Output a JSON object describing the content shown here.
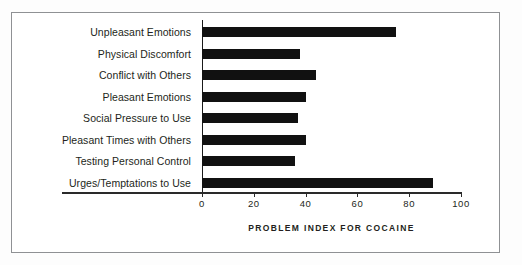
{
  "chart_data": {
    "type": "bar",
    "orientation": "horizontal",
    "title": "",
    "xlabel": "PROBLEM INDEX FOR COCAINE",
    "ylabel": "",
    "xlim": [
      0,
      100
    ],
    "xticks": [
      0,
      20,
      40,
      60,
      80,
      100
    ],
    "xtick_labels": [
      "0",
      "20",
      "40",
      "60",
      "80",
      "100"
    ],
    "grid": false,
    "legend": null,
    "bar_color": "#111111",
    "axis_color": "#2a2a2a",
    "frame_color": "#8f9194",
    "categories": [
      "Unpleasant Emotions",
      "Physical Discomfort",
      "Conflict with Others",
      "Pleasant Emotions",
      "Social Pressure to Use",
      "Pleasant Times with Others",
      "Testing Personal Control",
      "Urges/Temptations to Use"
    ],
    "values": [
      75,
      38,
      44,
      40,
      37,
      40,
      36,
      89
    ]
  }
}
